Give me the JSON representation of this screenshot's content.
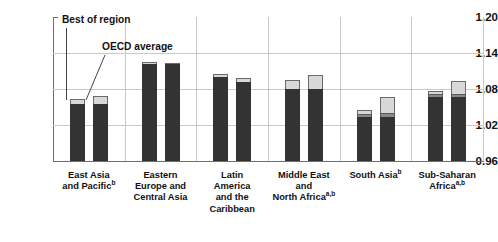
{
  "chart_data": {
    "type": "bar",
    "title": "",
    "xlabel": "",
    "ylabel": "",
    "ylim": [
      0.96,
      1.2
    ],
    "yticks": [
      "1.20",
      "1.14",
      "1.08",
      "1.02",
      "0.96"
    ],
    "ytick_values": [
      1.2,
      1.14,
      1.08,
      1.02,
      0.96
    ],
    "grid": true,
    "legend_position": "annotations",
    "annotations": [
      {
        "text": "Best of region",
        "points_to": "East Asia and Pacific - first bar"
      },
      {
        "text": "OECD average",
        "points_to": "East Asia and Pacific - second bar"
      }
    ],
    "series": [
      {
        "name": "Best of region",
        "values": [
          1.063,
          1.125,
          1.105,
          1.095,
          1.045,
          1.077
        ]
      },
      {
        "name": "OECD average",
        "values": [
          1.069,
          1.124,
          1.098,
          1.104,
          1.067,
          1.094
        ]
      }
    ],
    "categories": [
      "East Asia and Pacific",
      "Eastern Europe and Central Asia",
      "Latin America and the Caribbean",
      "Middle East and North Africa",
      "South Asia",
      "Sub-Saharan Africa"
    ],
    "category_labels": [
      {
        "lines": [
          "East Asia",
          "and Pacific"
        ],
        "footnote": "b"
      },
      {
        "lines": [
          "Eastern",
          "Europe and",
          "Central Asia"
        ],
        "footnote": ""
      },
      {
        "lines": [
          "Latin",
          "America",
          "and the",
          "Caribbean"
        ],
        "footnote": ""
      },
      {
        "lines": [
          "Middle East",
          "and",
          "North Africa"
        ],
        "footnote": "a,b"
      },
      {
        "lines": [
          "South Asia"
        ],
        "footnote": "b"
      },
      {
        "lines": [
          "Sub-Saharan",
          "Africa"
        ],
        "footnote": "a,b"
      }
    ],
    "bars": [
      {
        "category": "East Asia and Pacific",
        "series": "Best of region",
        "total": 1.063,
        "segments": [
          {
            "shade": "dark",
            "top": 1.0555
          },
          {
            "shade": "light",
            "top": 1.063
          }
        ]
      },
      {
        "category": "East Asia and Pacific",
        "series": "OECD average",
        "total": 1.069,
        "segments": [
          {
            "shade": "dark",
            "top": 1.0555
          },
          {
            "shade": "light",
            "top": 1.069
          }
        ]
      },
      {
        "category": "Eastern Europe and Central Asia",
        "series": "Best of region",
        "total": 1.125,
        "segments": [
          {
            "shade": "dark",
            "top": 1.1215
          },
          {
            "shade": "light",
            "top": 1.125
          }
        ]
      },
      {
        "category": "Eastern Europe and Central Asia",
        "series": "OECD average",
        "total": 1.124,
        "segments": [
          {
            "shade": "dark",
            "top": 1.1215
          },
          {
            "shade": "light",
            "top": 1.124
          }
        ]
      },
      {
        "category": "Latin America and the Caribbean",
        "series": "Best of region",
        "total": 1.105,
        "segments": [
          {
            "shade": "dark",
            "top": 1.0995
          },
          {
            "shade": "light",
            "top": 1.105
          }
        ]
      },
      {
        "category": "Latin America and the Caribbean",
        "series": "OECD average",
        "total": 1.098,
        "segments": [
          {
            "shade": "dark",
            "top": 1.0925
          },
          {
            "shade": "light",
            "top": 1.098
          }
        ]
      },
      {
        "category": "Middle East and North Africa",
        "series": "Best of region",
        "total": 1.095,
        "segments": [
          {
            "shade": "dark",
            "top": 1.0805
          },
          {
            "shade": "light",
            "top": 1.095
          }
        ]
      },
      {
        "category": "Middle East and North Africa",
        "series": "OECD average",
        "total": 1.104,
        "segments": [
          {
            "shade": "dark",
            "top": 1.0805
          },
          {
            "shade": "light",
            "top": 1.104
          }
        ]
      },
      {
        "category": "South Asia",
        "series": "Best of region",
        "total": 1.045,
        "segments": [
          {
            "shade": "dark",
            "top": 1.0335
          },
          {
            "shade": "mid",
            "top": 1.0385
          },
          {
            "shade": "light",
            "top": 1.045
          }
        ]
      },
      {
        "category": "South Asia",
        "series": "OECD average",
        "total": 1.067,
        "segments": [
          {
            "shade": "dark",
            "top": 1.0335
          },
          {
            "shade": "mid",
            "top": 1.0405
          },
          {
            "shade": "light",
            "top": 1.067
          }
        ]
      },
      {
        "category": "Sub-Saharan Africa",
        "series": "Best of region",
        "total": 1.077,
        "segments": [
          {
            "shade": "dark",
            "top": 1.0665
          },
          {
            "shade": "mid",
            "top": 1.0715
          },
          {
            "shade": "light",
            "top": 1.077
          }
        ]
      },
      {
        "category": "Sub-Saharan Africa",
        "series": "OECD average",
        "total": 1.094,
        "segments": [
          {
            "shade": "dark",
            "top": 1.0665
          },
          {
            "shade": "mid",
            "top": 1.0715
          },
          {
            "shade": "light",
            "top": 1.094
          }
        ]
      }
    ]
  },
  "colors": {
    "dark": "#333333",
    "mid": "#8a8a8a",
    "light": "#d8d8d8",
    "grid": "#c9c9c9",
    "axis": "#6e6e6e",
    "text": "#111111",
    "background": "#ffffff"
  }
}
